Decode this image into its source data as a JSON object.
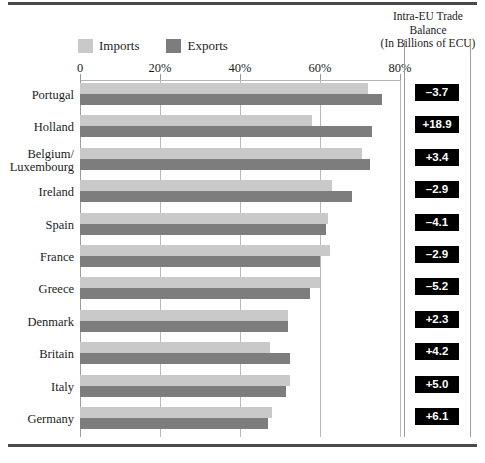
{
  "chart_data": {
    "type": "bar",
    "title": "",
    "orientation": "horizontal",
    "xlabel": "",
    "ylabel": "",
    "xlim": [
      0,
      80
    ],
    "x_tick_labels": [
      "0",
      "20%",
      "40%",
      "60%",
      "80%"
    ],
    "x_tick_values": [
      0,
      20,
      40,
      60,
      80
    ],
    "grid": true,
    "legend_position": "top-left",
    "categories": [
      "Portugal",
      "Holland",
      "Belgium/\nLuxembourg",
      "Ireland",
      "Spain",
      "France",
      "Greece",
      "Denmark",
      "Britain",
      "Italy",
      "Germany"
    ],
    "series": [
      {
        "name": "Imports",
        "color": "#c9c9c9",
        "values": [
          72.0,
          58.0,
          70.5,
          63.0,
          62.0,
          62.5,
          60.0,
          52.0,
          47.5,
          52.5,
          48.0
        ]
      },
      {
        "name": "Exports",
        "color": "#7d7d7d",
        "values": [
          75.5,
          73.0,
          72.5,
          68.0,
          61.5,
          60.0,
          57.5,
          52.0,
          52.5,
          51.5,
          47.0
        ]
      }
    ],
    "annotations": {
      "name": "Intra-EU Trade Balance (In Billions of ECU)",
      "values": [
        "–3.7",
        "+18.9",
        "+3.4",
        "–2.9",
        "–4.1",
        "–2.9",
        "–5.2",
        "+2.3",
        "+4.2",
        "+5.0",
        "+6.1"
      ]
    }
  },
  "header": {
    "line1": "Intra-EU Trade",
    "line2": "Balance",
    "line3": "(In Billions of ECU)"
  },
  "legend": {
    "imports_label": "Imports",
    "exports_label": "Exports"
  },
  "axis": {
    "ticks": [
      {
        "label": "0",
        "value": 0
      },
      {
        "label": "20%",
        "value": 20
      },
      {
        "label": "40%",
        "value": 40
      },
      {
        "label": "60%",
        "value": 60
      },
      {
        "label": "80%",
        "value": 80
      }
    ]
  },
  "rows": [
    {
      "country": "Portugal",
      "country_line2": "",
      "imports": 72.0,
      "exports": 75.5,
      "balance": "–3.7"
    },
    {
      "country": "Holland",
      "country_line2": "",
      "imports": 58.0,
      "exports": 73.0,
      "balance": "+18.9"
    },
    {
      "country": "Belgium/",
      "country_line2": "Luxembourg",
      "imports": 70.5,
      "exports": 72.5,
      "balance": "+3.4"
    },
    {
      "country": "Ireland",
      "country_line2": "",
      "imports": 63.0,
      "exports": 68.0,
      "balance": "–2.9"
    },
    {
      "country": "Spain",
      "country_line2": "",
      "imports": 62.0,
      "exports": 61.5,
      "balance": "–4.1"
    },
    {
      "country": "France",
      "country_line2": "",
      "imports": 62.5,
      "exports": 60.0,
      "balance": "–2.9"
    },
    {
      "country": "Greece",
      "country_line2": "",
      "imports": 60.0,
      "exports": 57.5,
      "balance": "–5.2"
    },
    {
      "country": "Denmark",
      "country_line2": "",
      "imports": 52.0,
      "exports": 52.0,
      "balance": "+2.3"
    },
    {
      "country": "Britain",
      "country_line2": "",
      "imports": 47.5,
      "exports": 52.5,
      "balance": "+4.2"
    },
    {
      "country": "Italy",
      "country_line2": "",
      "imports": 52.5,
      "exports": 51.5,
      "balance": "+5.0"
    },
    {
      "country": "Germany",
      "country_line2": "",
      "imports": 48.0,
      "exports": 47.0,
      "balance": "+6.1"
    }
  ],
  "colors": {
    "imports": "#c9c9c9",
    "exports": "#7d7d7d",
    "badge_bg": "#000000",
    "badge_fg": "#ffffff",
    "rule": "#4a4a4a"
  }
}
